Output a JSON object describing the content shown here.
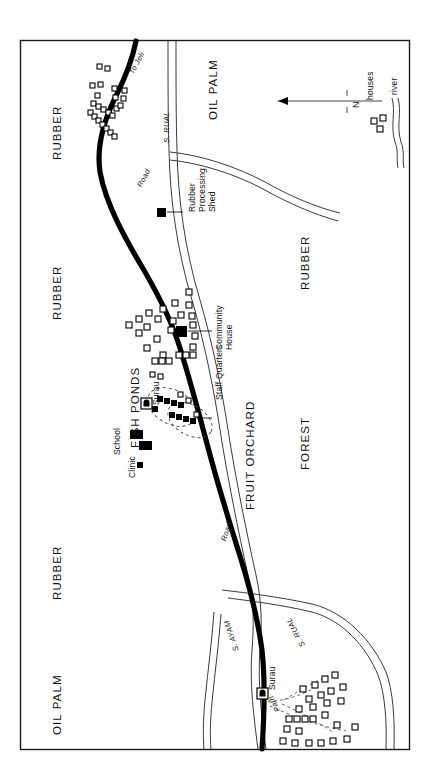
{
  "map": {
    "title_visible": false,
    "frame": {
      "x": 20,
      "y": 40,
      "width": 390,
      "height": 710,
      "stroke": "#1a1a1a"
    },
    "colors": {
      "road": "#000000",
      "river": "#3a3a3a",
      "house_outline": "#000000",
      "building_fill": "#000000",
      "frame": "#1a1a1a",
      "background": "#ffffff",
      "path": "#555555"
    },
    "area_labels": [
      {
        "name": "rubber-north",
        "text": "RUBBER",
        "x": 52,
        "y": 160
      },
      {
        "name": "rubber-mid",
        "text": "RUBBER",
        "x": 52,
        "y": 320
      },
      {
        "name": "rubber-east",
        "text": "RUBBER",
        "x": 300,
        "y": 290
      },
      {
        "name": "rubber-southwest",
        "text": "RUBBER",
        "x": 52,
        "y": 600
      },
      {
        "name": "oil-palm-north",
        "text": "OIL PALM",
        "x": 208,
        "y": 120
      },
      {
        "name": "oil-palm-south",
        "text": "OIL PALM",
        "x": 52,
        "y": 735
      },
      {
        "name": "fruit-orchard",
        "text": "FRUIT ORCHARD",
        "x": 245,
        "y": 510
      },
      {
        "name": "forest",
        "text": "FOREST",
        "x": 300,
        "y": 470
      },
      {
        "name": "fish-ponds",
        "text": "FISH PONDS",
        "x": 130,
        "y": 448
      }
    ],
    "feature_labels": [
      {
        "name": "rubber-processing-shed",
        "text": "Rubber\nProcessing\nShed",
        "x": 188,
        "y": 212
      },
      {
        "name": "community-house",
        "text": "Community\nHouse",
        "x": 215,
        "y": 350
      },
      {
        "name": "staff-quarters",
        "text": "Staff Quarters",
        "x": 215,
        "y": 400
      },
      {
        "name": "school",
        "text": "School",
        "x": 113,
        "y": 455
      },
      {
        "name": "clinic",
        "text": "Clinic",
        "x": 128,
        "y": 478
      },
      {
        "name": "surau-north",
        "text": "Surau",
        "x": 152,
        "y": 405
      },
      {
        "name": "surau-south",
        "text": "Surau",
        "x": 268,
        "y": 690
      }
    ],
    "route_labels": [
      {
        "name": "to-jeli",
        "text": "To Jeli",
        "x": 128,
        "y": 72
      },
      {
        "name": "road-north",
        "text": "Road",
        "x": 136,
        "y": 185
      },
      {
        "name": "road-south",
        "text": "Road",
        "x": 220,
        "y": 540
      },
      {
        "name": "river-s-rual-north",
        "text": "S. RUAL",
        "x": 163,
        "y": 143
      },
      {
        "name": "river-s-rual-south",
        "text": "S. RUAL",
        "x": 300,
        "y": 648
      },
      {
        "name": "river-s-ayam",
        "text": "S. AYAM",
        "x": 233,
        "y": 652
      },
      {
        "name": "path",
        "text": "Path",
        "x": 275,
        "y": 713
      }
    ],
    "legend": {
      "name": "map-legend",
      "north_label": "N",
      "items": [
        {
          "name": "legend-houses",
          "symbol": "houses-symbol",
          "label": "houses"
        },
        {
          "name": "legend-river",
          "symbol": "river-symbol",
          "label": "river"
        }
      ]
    }
  }
}
